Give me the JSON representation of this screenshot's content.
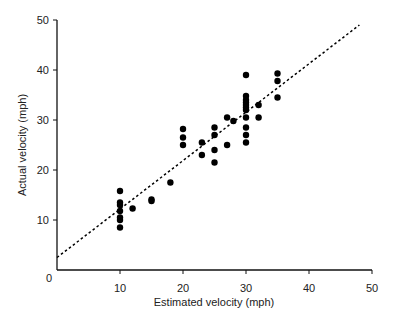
{
  "chart_data": {
    "type": "scatter",
    "title": "",
    "xlabel": "Estimated velocity (mph)",
    "ylabel": "Actual velocity (mph)",
    "xlim": [
      0,
      50
    ],
    "ylim": [
      0,
      50
    ],
    "xticks": [
      0,
      10,
      20,
      30,
      40,
      50
    ],
    "yticks": [
      0,
      10,
      20,
      30,
      40,
      50
    ],
    "grid": false,
    "legend": null,
    "series": [
      {
        "name": "observations",
        "marker": "filled-circle",
        "color": "#000000",
        "points": [
          [
            10,
            8.5
          ],
          [
            10,
            10
          ],
          [
            10,
            10.5
          ],
          [
            10,
            11.8
          ],
          [
            10,
            13
          ],
          [
            10,
            13.5
          ],
          [
            10,
            15.8
          ],
          [
            12,
            12.3
          ],
          [
            15,
            13.8
          ],
          [
            15,
            14.1
          ],
          [
            18,
            17.5
          ],
          [
            20,
            25
          ],
          [
            20,
            26.5
          ],
          [
            20,
            28.2
          ],
          [
            23,
            23
          ],
          [
            23,
            25.5
          ],
          [
            25,
            21.5
          ],
          [
            25,
            24
          ],
          [
            25,
            27
          ],
          [
            25,
            28.5
          ],
          [
            27,
            25
          ],
          [
            27,
            30.5
          ],
          [
            28,
            29.8
          ],
          [
            30,
            25.5
          ],
          [
            30,
            27
          ],
          [
            30,
            28.5
          ],
          [
            30,
            30.5
          ],
          [
            30,
            32
          ],
          [
            30,
            32.5
          ],
          [
            30,
            33
          ],
          [
            30,
            33.5
          ],
          [
            30,
            34
          ],
          [
            30,
            34.8
          ],
          [
            30,
            39
          ],
          [
            32,
            30.5
          ],
          [
            32,
            33
          ],
          [
            35,
            34.5
          ],
          [
            35,
            37.8
          ],
          [
            35,
            39.3
          ]
        ]
      },
      {
        "name": "fit line",
        "type": "line",
        "style": "dashed",
        "color": "#000000",
        "points": [
          [
            0,
            2.5
          ],
          [
            48,
            49
          ]
        ]
      }
    ]
  }
}
